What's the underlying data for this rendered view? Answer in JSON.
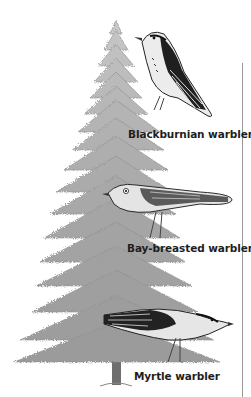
{
  "figure": {
    "colors": {
      "background": "#ffffff",
      "foliage": "#a8a8a8",
      "foliage_dark": "#7d7d7d",
      "trunk": "#6e6e6e",
      "bird_dark": "#1a1a1a",
      "bird_light": "#e8e8e8",
      "label_text": "#1e1e1e",
      "divider": "#9a9a9a"
    },
    "birds": [
      {
        "name": "blackburnian-warbler",
        "label": "Blackburnian warbler",
        "position": "top of tree"
      },
      {
        "name": "bay-breasted-warbler",
        "label": "Bay-breasted warbler",
        "position": "middle of tree"
      },
      {
        "name": "myrtle-warbler",
        "label": "Myrtle warbler",
        "position": "bottom of tree"
      }
    ]
  }
}
